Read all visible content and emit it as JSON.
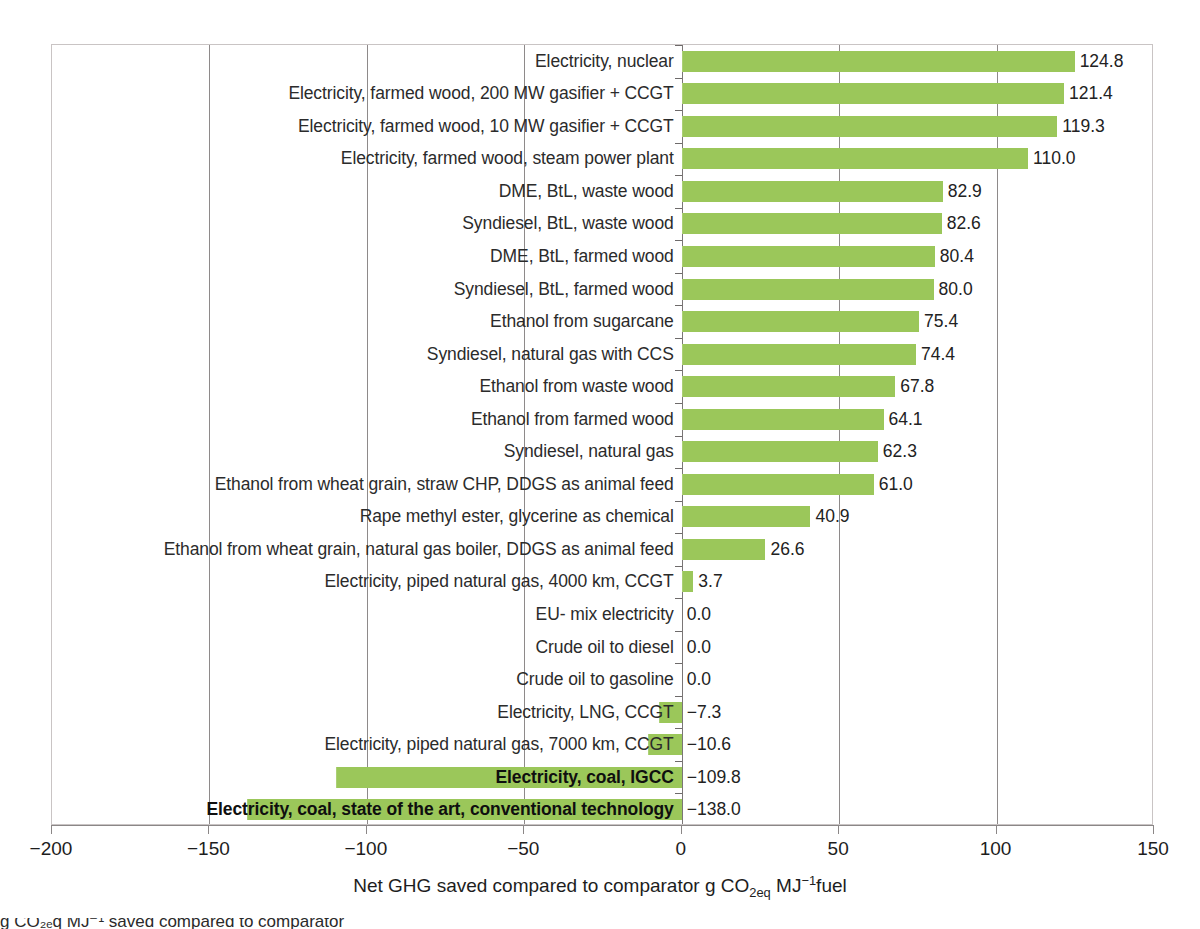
{
  "chart_data": {
    "type": "bar",
    "orientation": "horizontal",
    "title": "",
    "xlabel": "Net GHG saved compared to comparator g CO2eq MJ-1fuel",
    "xlabel_parts": {
      "pre": "Net GHG saved compared to comparator g CO",
      "sub1": "2eq",
      "mid": " MJ",
      "sup1": "−1",
      "post": "fuel"
    },
    "ylabel": "",
    "xlim": [
      -200,
      150
    ],
    "xticks": [
      -200,
      -150,
      -100,
      -50,
      0,
      50,
      100,
      150
    ],
    "xtick_labels": [
      "−200",
      "−150",
      "−100",
      "−50",
      "0",
      "50",
      "100",
      "150"
    ],
    "gridlines_x": [
      -150,
      -100,
      -50,
      0,
      50,
      100
    ],
    "grid": true,
    "legend": "none",
    "bar_color": "#9bc75a",
    "categories": [
      "Electricity, nuclear",
      "Electricity, farmed wood, 200 MW gasifier + CCGT",
      "Electricity, farmed wood, 10 MW gasifier + CCGT",
      "Electricity, farmed wood, steam power plant",
      "DME, BtL, waste wood",
      "Syndiesel, BtL, waste wood",
      "DME, BtL, farmed wood",
      "Syndiesel, BtL, farmed wood",
      "Ethanol from sugarcane",
      "Syndiesel, natural gas with CCS",
      "Ethanol from waste wood",
      "Ethanol from farmed wood",
      "Syndiesel, natural gas",
      "Ethanol from wheat grain, straw CHP, DDGS as animal feed",
      "Rape methyl ester, glycerine as chemical",
      "Ethanol from wheat grain, natural gas boiler, DDGS as animal feed",
      "Electricity, piped natural gas, 4000 km, CCGT",
      "EU- mix electricity",
      "Crude oil to diesel",
      "Crude oil to gasoline",
      "Electricity, LNG, CCGT",
      "Electricity, piped natural gas, 7000 km, CCGT",
      "Electricity, coal, IGCC",
      "Electricity, coal, state of the art, conventional technology"
    ],
    "values": [
      124.8,
      121.4,
      119.3,
      110.0,
      82.9,
      82.6,
      80.4,
      80.0,
      75.4,
      74.4,
      67.8,
      64.1,
      62.3,
      61.0,
      40.9,
      26.6,
      3.7,
      0.0,
      0.0,
      0.0,
      -7.3,
      -10.6,
      -109.8,
      -138.0
    ],
    "value_labels": [
      "124.8",
      "121.4",
      "119.3",
      "110.0",
      "82.9",
      "82.6",
      "80.4",
      "80.0",
      "75.4",
      "74.4",
      "67.8",
      "64.1",
      "62.3",
      "61.0",
      "40.9",
      "26.6",
      "3.7",
      "0.0",
      "0.0",
      "0.0",
      "−7.3",
      "−10.6",
      "−109.8",
      "−138.0"
    ],
    "bold_categories": [
      "Electricity, coal, IGCC",
      "Electricity, coal, state of the art, conventional technology"
    ]
  },
  "caption": {
    "clipped_line": "g CO₂ₑq MJ⁻¹ saved compared to comparator"
  }
}
